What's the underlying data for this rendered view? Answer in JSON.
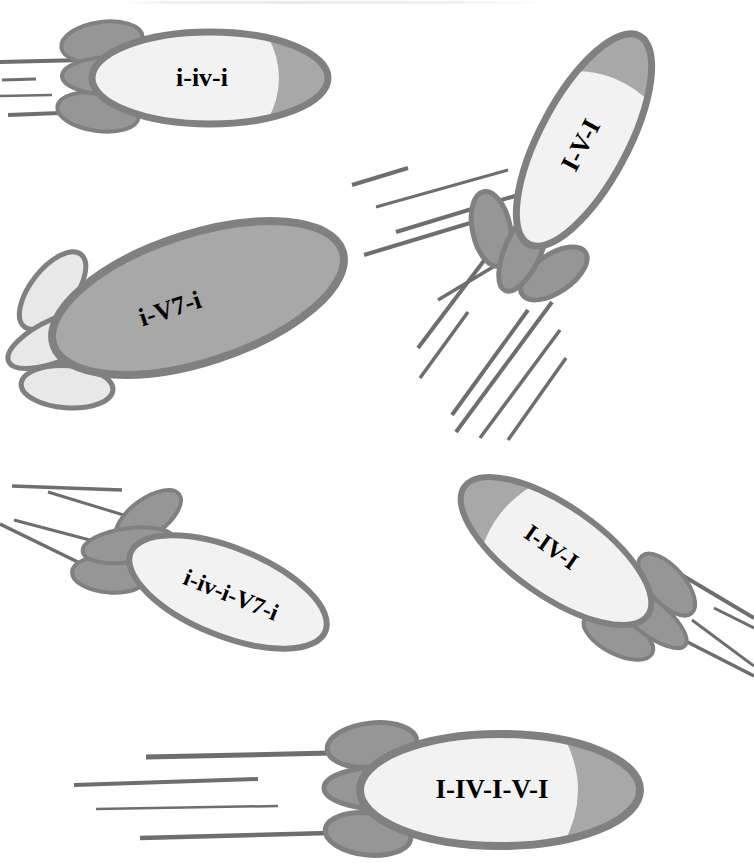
{
  "figure": {
    "background_color": "#ffffff",
    "width": 754,
    "height": 863
  },
  "palette": {
    "outline": "#808080",
    "nose_gray": "#a8a8a8",
    "body_white": "#f2f2f2",
    "fin_gray": "#969696",
    "fin_light": "#e8e8e8",
    "speed_line": "#6e6e6e",
    "text": "#000000"
  },
  "rockets": [
    {
      "id": "rocket-i-iv-i",
      "label": "i-iv-i",
      "angle_deg": 0,
      "body_fill": "#f2f2f2",
      "nose_fill": "#a8a8a8",
      "fin_fill": "#969696",
      "font_size": 26,
      "speed_lines": 4,
      "position": "top-left"
    },
    {
      "id": "rocket-i-v7-i",
      "label": "i-V7-i",
      "angle_deg": -18,
      "body_fill": "#a8a8a8",
      "nose_fill": "#a8a8a8",
      "fin_fill": "#e8e8e8",
      "font_size": 26,
      "speed_lines": 5,
      "position": "middle-left"
    },
    {
      "id": "rocket-I-V-I",
      "label": "I-V-I",
      "angle_deg": -62,
      "body_fill": "#f2f2f2",
      "nose_fill": "#a8a8a8",
      "fin_fill": "#969696",
      "font_size": 26,
      "speed_lines": 6,
      "position": "top-right"
    },
    {
      "id": "rocket-i-iv-i-v7-i",
      "label": "i-iv-i-V7-i",
      "angle_deg": 22,
      "body_fill": "#f2f2f2",
      "nose_fill": "#f2f2f2",
      "fin_fill": "#969696",
      "font_size": 24,
      "speed_lines": 4,
      "position": "lower-left"
    },
    {
      "id": "rocket-I-IV-I",
      "label": "I-IV-I",
      "angle_deg": 35,
      "body_fill": "#f2f2f2",
      "nose_fill": "#a8a8a8",
      "fin_fill": "#969696",
      "font_size": 24,
      "speed_lines": 4,
      "position": "lower-right"
    },
    {
      "id": "rocket-I-IV-I-V-I",
      "label": "I-IV-I-V-I",
      "angle_deg": 0,
      "body_fill": "#f2f2f2",
      "nose_fill": "#a8a8a8",
      "fin_fill": "#969696",
      "font_size": 27,
      "speed_lines": 4,
      "position": "bottom"
    }
  ]
}
